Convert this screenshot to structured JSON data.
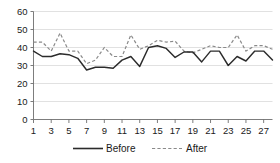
{
  "chart_data": {
    "type": "line",
    "title": "",
    "subtitle": "",
    "xlabel": "",
    "ylabel": "",
    "x": [
      1,
      2,
      3,
      4,
      5,
      6,
      7,
      8,
      9,
      10,
      11,
      12,
      13,
      14,
      15,
      16,
      17,
      18,
      19,
      20,
      21,
      22,
      23,
      24,
      25,
      26,
      27,
      28
    ],
    "xlim": [
      1,
      28
    ],
    "ylim": [
      0,
      60
    ],
    "yticks": [
      0,
      10,
      20,
      30,
      40,
      50,
      60
    ],
    "ytick_labels": [
      "0",
      "10",
      "20",
      "30",
      "40",
      "50",
      "60"
    ],
    "xtick_labels": [
      "1",
      "3",
      "5",
      "7",
      "9",
      "11",
      "13",
      "15",
      "17",
      "19",
      "21",
      "23",
      "25",
      "27"
    ],
    "xticks": [
      1,
      3,
      5,
      7,
      9,
      11,
      13,
      15,
      17,
      19,
      21,
      23,
      25,
      27
    ],
    "grid": true,
    "grid_axis": "y",
    "legend_position": "bottom",
    "series": [
      {
        "name": "Before",
        "style": "solid",
        "color": "#2b2b2b",
        "values": [
          38,
          35,
          35,
          36.5,
          36,
          34,
          27.5,
          29,
          29,
          28.5,
          33,
          35,
          29.5,
          40,
          41,
          39.5,
          34.5,
          37.5,
          37.5,
          32,
          38,
          38,
          30,
          35,
          32.5,
          38,
          38,
          33
        ]
      },
      {
        "name": "After",
        "style": "dashed",
        "color": "#8a8a8a",
        "values": [
          43,
          43,
          38,
          48,
          38,
          38,
          31,
          33,
          40,
          35,
          35,
          47,
          39,
          41,
          44,
          43,
          43.5,
          38,
          37,
          39,
          41,
          40,
          40,
          47,
          38,
          41,
          41,
          39
        ]
      }
    ]
  },
  "legend": {
    "items": [
      {
        "label": "Before",
        "style": "solid",
        "color": "#2b2b2b"
      },
      {
        "label": "After",
        "style": "dashed",
        "color": "#8a8a8a"
      }
    ]
  },
  "colors": {
    "background": "#ffffff",
    "grid": "#d4d4d4",
    "axis": "#6e6e6e",
    "text": "#1a1a1a",
    "before": "#2b2b2b",
    "after": "#8a8a8a"
  }
}
